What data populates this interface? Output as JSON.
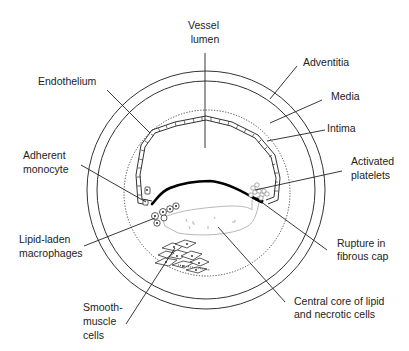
{
  "diagram": {
    "labels": {
      "vessel_lumen": [
        "Vessel",
        "lumen"
      ],
      "endothelium": [
        "Endothelium"
      ],
      "adventitia": [
        "Adventitia"
      ],
      "media": [
        "Media"
      ],
      "intima": [
        "Intima"
      ],
      "adherent_monocyte": [
        "Adherent",
        "monocyte"
      ],
      "activated_platelets": [
        "Activated",
        "platelets"
      ],
      "lipid_laden_macrophages": [
        "Lipid-laden",
        "macrophages"
      ],
      "rupture_in_fibrous_cap": [
        "Rupture in",
        "fibrous cap"
      ],
      "smooth_muscle_cells": [
        "Smooth-",
        "muscle",
        "cells"
      ],
      "central_core": [
        "Central core of lipid",
        "and necrotic cells"
      ]
    },
    "colors": {
      "line": "#222222",
      "core_outline": "#b8b8b8",
      "background": "#ffffff"
    }
  }
}
